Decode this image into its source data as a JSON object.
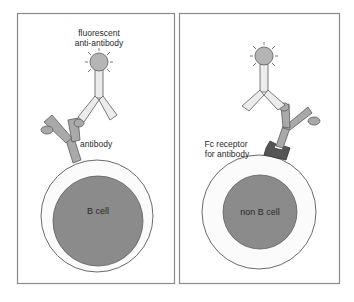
{
  "colors": {
    "panel_border": "#8a8a8a",
    "cell_outer_fill": "#fbfbfb",
    "cell_outer_stroke": "#6a6a6a",
    "nucleus_fill": "#8b8b8b",
    "antibody_fill": "#a9a9a9",
    "anti_antibody_fill": "#ececec",
    "fluor_fill": "#b5b5b5",
    "receptor_fill": "#555555",
    "text": "#2a2a2a"
  },
  "panels": [
    {
      "id": "left",
      "labels": {
        "fluorescent_line1": "fluorescent",
        "fluorescent_line2": "anti-antibody",
        "antibody": "antibody",
        "cell": "B cell"
      }
    },
    {
      "id": "right",
      "labels": {
        "receptor_line1": "Fc receptor",
        "receptor_line2": "for antibody",
        "cell": "non B cell"
      }
    }
  ]
}
